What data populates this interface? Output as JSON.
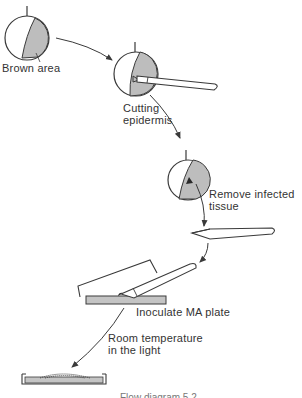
{
  "diagram": {
    "type": "flow-diagram",
    "steps": [
      {
        "id": "apple-brown",
        "label": "Brown area"
      },
      {
        "id": "cut",
        "label_lines": [
          "Cutting",
          "epidermis"
        ]
      },
      {
        "id": "remove",
        "label_lines": [
          "Remove infected",
          "tissue"
        ]
      },
      {
        "id": "inoculate",
        "label": "Inoculate MA plate"
      },
      {
        "id": "incubate",
        "label_lines": [
          "Room temperature",
          "in the light"
        ]
      }
    ],
    "caption": "Flow diagram 5.2",
    "colors": {
      "line": "#3a3a3a",
      "infected_fill": "#bdbdbd",
      "medium_fill": "#c4c4c4",
      "background": "#ffffff"
    }
  }
}
